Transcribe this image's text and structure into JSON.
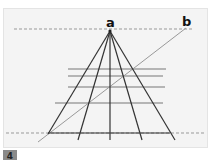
{
  "figure": {
    "panel_number": "4",
    "labels": {
      "a": "a",
      "b": "b"
    },
    "colors": {
      "panel_bg": "#f4f4f4",
      "dark_line": "#333333",
      "gray_line": "#888888",
      "dashed": "#999999"
    },
    "vanishing_point": [
      110,
      31
    ],
    "converging_lines_end_x": [
      38,
      78,
      110,
      142,
      175
    ],
    "horizontal_lines": [
      {
        "y": 69,
        "x1": 68,
        "x2": 166
      },
      {
        "y": 76,
        "x1": 68,
        "x2": 163
      },
      {
        "y": 87,
        "x1": 68,
        "x2": 165
      },
      {
        "y": 103,
        "x1": 55,
        "x2": 163
      }
    ],
    "baseline": {
      "y": 133,
      "x1": 48,
      "x2": 170
    },
    "dashed_lines": [
      {
        "y": 29,
        "x1": 14,
        "x2": 192
      },
      {
        "y": 133,
        "x1": 6,
        "x2": 205
      }
    ],
    "diagonal_b": {
      "x1": 186,
      "y1": 28,
      "x2": 38,
      "y2": 142
    }
  }
}
